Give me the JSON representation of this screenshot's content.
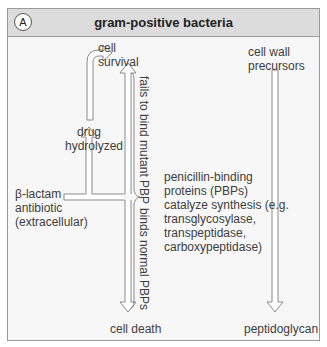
{
  "panel": {
    "label": "A",
    "title": "gram-positive bacteria"
  },
  "nodes": {
    "cell_survival": [
      "cell",
      "survival"
    ],
    "drug_hydrolyzed": [
      "drug",
      "hydrolyzed"
    ],
    "beta_lactam": [
      "β-lactam",
      "antibiotic",
      "(extracellular)"
    ],
    "cell_death": "cell death",
    "cell_wall_precursors": [
      "cell wall",
      "precursors"
    ],
    "pbp_description": [
      "penicillin-binding",
      "proteins (PBPs)",
      "catalyze synthesis (e.g.",
      "transglycosylase,",
      "transpeptidase,",
      "carboxypeptidase)"
    ],
    "peptidoglycan": "peptidoglycan"
  },
  "edge_labels": {
    "fails_to_bind": "fails to bind mutant PBP",
    "binds_normal": "binds normal PBPs"
  },
  "colors": {
    "frame_border": "#9a9a9a",
    "header_bg": "#dcdcdc",
    "body_bg": "#f7f7f7",
    "arrow_stroke": "#8a8a8a",
    "arrow_fill": "#ffffff",
    "text": "#3d3d3d"
  }
}
